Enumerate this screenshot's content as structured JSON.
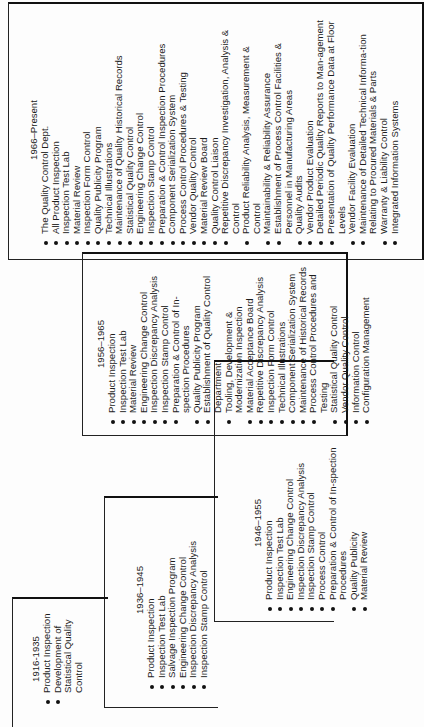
{
  "figure": {
    "orientation": "rotated 90 degrees counter-clockwise",
    "periods": [
      {
        "id": "1916-1935",
        "title": "1916-1935",
        "items": [
          "Product Inspection",
          "Development of Statistical Quality Control"
        ]
      },
      {
        "id": "1936-1945",
        "title": "1936–1945",
        "items": [
          "Product Inspection",
          "Inspection Test Lab",
          "Salvage Inspection Program",
          "Engineering Change Control",
          "Inspection Discrepancy Analysis",
          "Inspection Stamp Control"
        ]
      },
      {
        "id": "1946-1955",
        "title": "1946–1955",
        "items": [
          "Product Inspection",
          "Inspection Test Lab",
          "Engineering Change Control",
          "Inspection Discrepancy Analysis",
          "Inspection Stamp Control",
          "Process Control",
          "Preparation & Control of In-spection Procedures",
          "Quality Publicity",
          "Material Review"
        ]
      },
      {
        "id": "1956-1965",
        "title": "1956–1965",
        "items": [
          "Product Inspection",
          "Inspection Test Lab",
          "Material Review",
          "Engineering Change Control",
          "Inspection Discrepancy Analysis",
          "Inspection Stamp Control",
          "Preparation & Control of In-spection Procedures",
          "Quality Publicity Program",
          "Establishment of Quality Control Department",
          "Tooling, Development & Modernization Inspection",
          "Material Acceptance Board",
          "Repetitive Discrepancy Analysis",
          "Inspection Form Control",
          "Technical Illustrations",
          "Component Serialization System",
          "Maintenance of Historical Records",
          "Process Control Procedures and Testing",
          "Statistical Quality Control",
          "Vendor Quality Control",
          "Information Control",
          "Configuration Management"
        ]
      },
      {
        "id": "1966-present",
        "title": "1966–Present",
        "items": [
          "The Quality Control Dept.",
          "All Product Inspection",
          "Inspection Test Lab",
          "Material Review",
          "Inspection Form Control",
          "Quality Publicity Program",
          "Technical Illustrations",
          "Maintenance of Quality Historical Records",
          "Statistical Quality Control",
          "Engineering Change Control",
          "Inspection Stamp Control",
          "Preparation & Control Inspection Procedures",
          "Component Serialization System",
          "Process Control Procedures & Testing",
          "Vendor Quality Control",
          "Material Review Board",
          "Quality Control Liaison",
          "Repetitive Discrepancy Investigation, Analysis & Control",
          "Product Reliability Analysis, Measurement & Control",
          "Maintainability & Reliability Assurance",
          "Establishment of Process Control Facilities & Personnel in Manufacturing Areas",
          "Quality Audits",
          "Vendor Product Evaluation",
          "Detailed Periodic Quality Reports to Man-agement",
          "Presentation of Quality Performance Data at Floor Levels",
          "Vendor Facility Evaluation",
          "Maintenance of Detailed Technical Informa-tion Relating to Procured Materials & Parts",
          "Warranty & Liability Control",
          "Integrated Information Systems"
        ]
      }
    ]
  }
}
